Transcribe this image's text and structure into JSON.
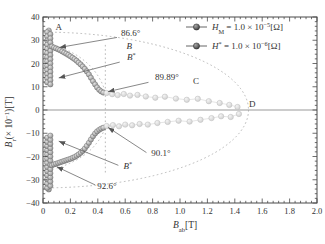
{
  "figure": {
    "bg": "#ffffff",
    "frame_color": "#4a4a4a",
    "zero_line_color": "#999999",
    "guide_color": "#b0b0b0",
    "pointer_color": "#555555",
    "text_color": "#3a3a3a",
    "connector_color": "#dedede"
  },
  "chart_data": {
    "type": "scatter",
    "title": "",
    "xlabel": "B_ab [T]",
    "ylabel": "B_r (x10^-1) [T]",
    "xlabel_parts": [
      {
        "t": "B",
        "s": "it"
      },
      {
        "t": "ab",
        "s": "sub"
      },
      {
        "t": "[T]",
        "s": "n"
      }
    ],
    "ylabel_parts": [
      {
        "t": "B",
        "s": "it"
      },
      {
        "t": "r",
        "s": "sub"
      },
      {
        "t": "(× 10",
        "s": "n"
      },
      {
        "t": "−1",
        "s": "sup"
      },
      {
        "t": ")[T]",
        "s": "n"
      }
    ],
    "xlim": [
      0,
      2.0
    ],
    "ylim": [
      -40,
      40
    ],
    "grid": false,
    "x_ticks": {
      "values": [
        0,
        0.2,
        0.4,
        0.6,
        0.8,
        1.0,
        1.2,
        1.4,
        1.6,
        1.8,
        2.0
      ],
      "labels": [
        "0",
        "0.2",
        "0.4",
        "0.6",
        "0.8",
        "1.0",
        "1.2",
        "1.4",
        "1.6",
        "1.8",
        "2.0"
      ],
      "minor_step": 0.04
    },
    "y_ticks": {
      "values": [
        40,
        30,
        20,
        10,
        0,
        -10,
        -20,
        -30,
        -40
      ],
      "labels": [
        "40",
        "30",
        "20",
        "10",
        "0",
        "−10",
        "−20",
        "−30",
        "−40"
      ],
      "minor_step": 2
    },
    "legend": {
      "position": "top-right",
      "entries": [
        {
          "id": "HM",
          "label": "H_M = 1.0 × 10^-5 [Ω]",
          "parts": [
            {
              "t": "H",
              "s": "it"
            },
            {
              "t": "M",
              "s": "sub"
            },
            {
              "t": " = 1.0 × 10",
              "s": "n"
            },
            {
              "t": "−5",
              "s": "sup"
            },
            {
              "t": "[Ω]",
              "s": "n"
            }
          ]
        },
        {
          "id": "Hstar",
          "label": "H* = 1.0 × 10^-6 [Ω]",
          "parts": [
            {
              "t": "H",
              "s": "it"
            },
            {
              "t": "*",
              "s": "sup"
            },
            {
              "t": " = 1.0 × 10",
              "s": "n"
            },
            {
              "t": "−6",
              "s": "sup"
            },
            {
              "t": "[Ω]",
              "s": "n"
            }
          ]
        }
      ]
    },
    "marker_styles": {
      "dark": {
        "inner": "#e4e4e4",
        "outer": "#8a8a8a",
        "stroke": "#6e6e6e",
        "r": 2.6
      },
      "faded": {
        "inner": "#f4f4f4",
        "outer": "#cfcfcf",
        "stroke": "#bdbdbd",
        "r": 2.7
      },
      "legend": {
        "inner": "#a8a8a8",
        "outer": "#383838",
        "stroke": "#2e2e2e",
        "r": 3.1
      }
    },
    "guides": {
      "ellipse": {
        "cx": 0,
        "cy": 0,
        "rx": 1.5,
        "ry": 33.5
      },
      "vline": {
        "x": 0.455,
        "y1": 28,
        "y2": -28
      },
      "arcs": [
        {
          "from": [
            0.1,
            27.5
          ],
          "ctrl": [
            0.38,
            22.0
          ],
          "to": [
            0.455,
            7.8
          ]
        },
        {
          "from": [
            0.1,
            -25.0
          ],
          "ctrl": [
            0.38,
            -20.0
          ],
          "to": [
            0.455,
            -7.4
          ]
        }
      ]
    },
    "series": [
      {
        "name": "upper-cluster",
        "style": "dark",
        "connect": false,
        "points": [
          [
            0.042,
            34.2
          ],
          [
            0.03,
            33.5
          ],
          [
            0.03,
            31.7
          ],
          [
            0.03,
            29.9
          ],
          [
            0.03,
            28.1
          ],
          [
            0.03,
            26.3
          ],
          [
            0.03,
            24.5
          ],
          [
            0.03,
            22.7
          ],
          [
            0.03,
            20.9
          ],
          [
            0.03,
            19.1
          ],
          [
            0.03,
            17.3
          ],
          [
            0.03,
            15.5
          ],
          [
            0.03,
            13.7
          ],
          [
            0.03,
            11.9
          ],
          [
            0.054,
            32.6
          ],
          [
            0.054,
            30.8
          ],
          [
            0.054,
            29.0
          ],
          [
            0.054,
            27.2
          ],
          [
            0.054,
            25.4
          ],
          [
            0.054,
            23.6
          ],
          [
            0.054,
            21.8
          ],
          [
            0.054,
            20.0
          ],
          [
            0.054,
            18.2
          ],
          [
            0.054,
            16.4
          ],
          [
            0.054,
            14.6
          ],
          [
            0.054,
            12.8
          ],
          [
            0.054,
            11.0
          ]
        ]
      },
      {
        "name": "upper-branch",
        "style": "dark",
        "connect": false,
        "points": [
          [
            0.065,
            27.3
          ],
          [
            0.08,
            26.9
          ],
          [
            0.095,
            26.5
          ],
          [
            0.11,
            26.1
          ],
          [
            0.125,
            25.7
          ],
          [
            0.14,
            25.2
          ],
          [
            0.155,
            24.7
          ],
          [
            0.17,
            24.2
          ],
          [
            0.185,
            23.7
          ],
          [
            0.2,
            23.1
          ],
          [
            0.215,
            22.5
          ],
          [
            0.23,
            21.9
          ],
          [
            0.245,
            21.2
          ],
          [
            0.26,
            20.4
          ],
          [
            0.275,
            19.6
          ],
          [
            0.29,
            18.7
          ],
          [
            0.305,
            17.7
          ],
          [
            0.32,
            16.6
          ],
          [
            0.335,
            15.3
          ],
          [
            0.35,
            13.9
          ],
          [
            0.365,
            12.4
          ],
          [
            0.38,
            11.0
          ],
          [
            0.395,
            9.7
          ],
          [
            0.41,
            8.7
          ],
          [
            0.425,
            8.0
          ],
          [
            0.44,
            7.5
          ]
        ]
      },
      {
        "name": "lower-cluster",
        "style": "dark",
        "connect": false,
        "points": [
          [
            0.042,
            -34.2
          ],
          [
            0.03,
            -33.5
          ],
          [
            0.03,
            -31.7
          ],
          [
            0.03,
            -29.9
          ],
          [
            0.03,
            -28.1
          ],
          [
            0.03,
            -26.3
          ],
          [
            0.03,
            -24.5
          ],
          [
            0.03,
            -22.7
          ],
          [
            0.03,
            -20.9
          ],
          [
            0.03,
            -19.1
          ],
          [
            0.03,
            -17.3
          ],
          [
            0.03,
            -15.5
          ],
          [
            0.03,
            -13.7
          ],
          [
            0.03,
            -11.9
          ],
          [
            0.054,
            -32.6
          ],
          [
            0.054,
            -30.8
          ],
          [
            0.054,
            -29.0
          ],
          [
            0.054,
            -27.2
          ],
          [
            0.054,
            -25.4
          ],
          [
            0.054,
            -23.6
          ],
          [
            0.054,
            -21.8
          ],
          [
            0.054,
            -20.0
          ],
          [
            0.054,
            -18.2
          ],
          [
            0.054,
            -16.4
          ],
          [
            0.054,
            -14.6
          ],
          [
            0.054,
            -12.8
          ],
          [
            0.054,
            -11.0
          ]
        ]
      },
      {
        "name": "lower-branch",
        "style": "dark",
        "connect": false,
        "points": [
          [
            0.065,
            -23.8
          ],
          [
            0.08,
            -23.4
          ],
          [
            0.095,
            -23.1
          ],
          [
            0.11,
            -22.8
          ],
          [
            0.125,
            -22.5
          ],
          [
            0.14,
            -22.2
          ],
          [
            0.155,
            -21.9
          ],
          [
            0.17,
            -21.6
          ],
          [
            0.185,
            -21.3
          ],
          [
            0.2,
            -21.0
          ],
          [
            0.215,
            -20.6
          ],
          [
            0.23,
            -20.2
          ],
          [
            0.245,
            -19.7
          ],
          [
            0.26,
            -19.1
          ],
          [
            0.275,
            -18.4
          ],
          [
            0.29,
            -17.6
          ],
          [
            0.305,
            -16.6
          ],
          [
            0.32,
            -15.4
          ],
          [
            0.335,
            -14.1
          ],
          [
            0.35,
            -12.7
          ],
          [
            0.365,
            -11.3
          ],
          [
            0.38,
            -10.1
          ],
          [
            0.395,
            -9.2
          ],
          [
            0.41,
            -8.5
          ],
          [
            0.425,
            -8.0
          ],
          [
            0.44,
            -7.6
          ]
        ]
      },
      {
        "name": "upper-faded",
        "style": "faded",
        "connect": true,
        "points": [
          [
            0.465,
            7.3
          ],
          [
            0.505,
            6.8
          ],
          [
            0.545,
            6.4
          ],
          [
            0.59,
            6.9
          ],
          [
            0.635,
            6.2
          ],
          [
            0.69,
            6.5
          ],
          [
            0.75,
            5.8
          ],
          [
            0.82,
            5.3
          ],
          [
            0.89,
            5.7
          ],
          [
            0.97,
            4.9
          ],
          [
            1.05,
            4.4
          ],
          [
            1.13,
            4.8
          ],
          [
            1.21,
            3.8
          ],
          [
            1.29,
            3.0
          ],
          [
            1.36,
            2.2
          ],
          [
            1.42,
            1.3
          ]
        ]
      },
      {
        "name": "lower-faded",
        "style": "faded",
        "connect": true,
        "points": [
          [
            0.465,
            -6.9
          ],
          [
            0.51,
            -6.5
          ],
          [
            0.555,
            -7.0
          ],
          [
            0.6,
            -6.3
          ],
          [
            0.65,
            -6.6
          ],
          [
            0.705,
            -6.0
          ],
          [
            0.765,
            -6.3
          ],
          [
            0.835,
            -5.6
          ],
          [
            0.91,
            -5.1
          ],
          [
            0.99,
            -4.6
          ],
          [
            1.07,
            -5.0
          ],
          [
            1.15,
            -4.2
          ],
          [
            1.23,
            -3.5
          ],
          [
            1.3,
            -2.7
          ],
          [
            1.37,
            -3.0
          ],
          [
            1.43,
            -1.7
          ]
        ]
      }
    ],
    "annotations": [
      {
        "id": "point-A",
        "text": "A",
        "x": 0.115,
        "y": 34.6
      },
      {
        "id": "angle-86-6",
        "text": "86.6°",
        "x": 0.64,
        "y": 32.0,
        "from": [
          0.54,
          31.2
        ],
        "to": [
          0.12,
          26.9
        ]
      },
      {
        "id": "point-B",
        "text": "B",
        "x": 0.63,
        "y": 26.3,
        "italic": true
      },
      {
        "id": "point-B-star-top",
        "text": "B*",
        "x": 0.645,
        "y": 21.3,
        "parts": [
          {
            "t": "B",
            "s": "it"
          },
          {
            "t": "*",
            "s": "sup"
          }
        ],
        "from": [
          0.56,
          20.6
        ],
        "to": [
          0.115,
          13.8
        ]
      },
      {
        "id": "angle-89-89",
        "text": "89.89°",
        "x": 0.905,
        "y": 12.7,
        "from": [
          0.77,
          11.9
        ],
        "to": [
          0.475,
          7.9
        ]
      },
      {
        "id": "point-C",
        "text": "C",
        "x": 1.117,
        "y": 11.2
      },
      {
        "id": "point-D",
        "text": "D",
        "x": 1.527,
        "y": 1.2
      },
      {
        "id": "angle-90-1",
        "text": "90.1°",
        "x": 0.86,
        "y": -19.6,
        "from": [
          0.755,
          -18.3
        ],
        "to": [
          0.475,
          -7.5
        ]
      },
      {
        "id": "point-B-star-bottom",
        "text": "B*",
        "x": 0.62,
        "y": -25.2,
        "parts": [
          {
            "t": "B",
            "s": "it"
          },
          {
            "t": "*",
            "s": "sup"
          }
        ],
        "from": [
          0.55,
          -23.8
        ],
        "to": [
          0.115,
          -13.4
        ]
      },
      {
        "id": "angle-92-6",
        "text": "92.6°",
        "x": 0.467,
        "y": -33.8,
        "from": [
          0.38,
          -32.2
        ],
        "to": [
          0.1,
          -24.4
        ]
      }
    ]
  }
}
